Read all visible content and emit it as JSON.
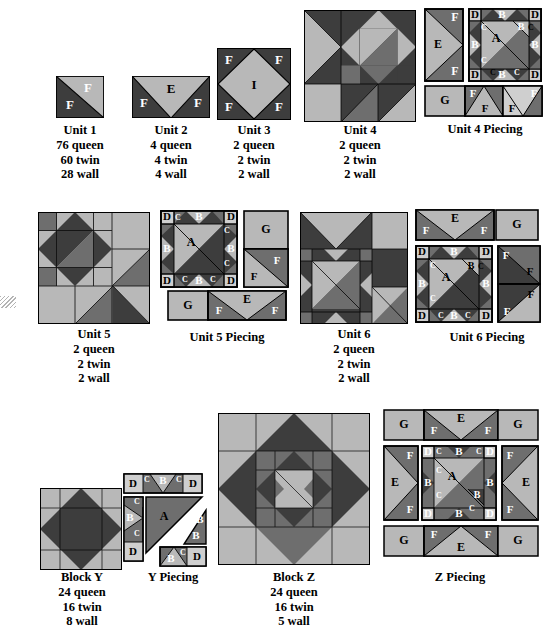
{
  "page": {
    "background": "#ffffff"
  },
  "palette": {
    "dark": "#3d3d3d",
    "medium": "#6e6e6e",
    "light": "#b8b8b8",
    "pale": "#cfcfcf",
    "outline": "#000000",
    "label_light": "#ffffff",
    "label_dark": "#000000"
  },
  "patch_codes": {
    "A": "large light triangle",
    "B": "medium triangle",
    "C": "small dark triangle",
    "D": "light corner square",
    "E": "large light triangle in rectangle",
    "F": "half square triangle",
    "G": "plain light rectangle",
    "I": "large light center square on point"
  },
  "figures": [
    {
      "id": "unit-1",
      "name": "Unit 1",
      "caption": [
        "Unit 1",
        "76 queen",
        "60 twin",
        "28 wall"
      ],
      "labels": [
        "F",
        "F"
      ]
    },
    {
      "id": "unit-2",
      "name": "Unit 2",
      "caption": [
        "Unit 2",
        "4 queen",
        "4 twin",
        "4 wall"
      ],
      "labels": [
        "F",
        "E",
        "F"
      ]
    },
    {
      "id": "unit-3",
      "name": "Unit 3",
      "caption": [
        "Unit 3",
        "2 queen",
        "2 twin",
        "2 wall"
      ],
      "labels": [
        "F",
        "F",
        "I",
        "F",
        "F"
      ]
    },
    {
      "id": "unit-4",
      "name": "Unit 4",
      "caption": [
        "Unit 4",
        "2 queen",
        "2 twin",
        "2 wall"
      ],
      "labels": []
    },
    {
      "id": "unit-4-piecing",
      "name": "Unit 4 Piecing",
      "caption": [
        "Unit 4 Piecing"
      ],
      "labels": [
        "F",
        "E",
        "F",
        "D",
        "B",
        "B",
        "D",
        "C",
        "C",
        "B",
        "A",
        "B",
        "C",
        "C",
        "D",
        "B",
        "D",
        "G",
        "F",
        "F",
        "F",
        "F"
      ]
    },
    {
      "id": "unit-5",
      "name": "Unit 5",
      "caption": [
        "Unit 5",
        "2 queen",
        "2 twin",
        "2 wall"
      ],
      "labels": []
    },
    {
      "id": "unit-5-piecing",
      "name": "Unit 5 Piecing",
      "caption": [
        "Unit 5 Piecing"
      ],
      "labels": [
        "D",
        "C",
        "B",
        "D",
        "B",
        "C",
        "B",
        "A",
        "B",
        "C",
        "D",
        "C",
        "B",
        "C",
        "D",
        "G",
        "F",
        "F",
        "G",
        "F",
        "E",
        "F"
      ]
    },
    {
      "id": "unit-6",
      "name": "Unit 6",
      "caption": [
        "Unit 6",
        "2 queen",
        "2 twin",
        "2 wall"
      ],
      "labels": []
    },
    {
      "id": "unit-6-piecing",
      "name": "Unit 6 Piecing",
      "caption": [
        "Unit 6 Piecing"
      ],
      "labels": [
        "F",
        "E",
        "F",
        "G",
        "D",
        "B",
        "D",
        "C",
        "B",
        "C",
        "B",
        "A",
        "B",
        "C",
        "C",
        "D",
        "B",
        "D",
        "F",
        "F",
        "F",
        "F"
      ]
    },
    {
      "id": "block-y",
      "name": "Block Y",
      "caption": [
        "Block Y",
        "24 queen",
        "16 twin",
        "8 wall"
      ],
      "labels": []
    },
    {
      "id": "y-piecing",
      "name": "Y Piecing",
      "caption": [
        "Y Piecing"
      ],
      "labels": [
        "D",
        "C",
        "B",
        "C",
        "D",
        "C",
        "B",
        "C",
        "D",
        "A",
        "B",
        "B",
        "B",
        "C",
        "D"
      ]
    },
    {
      "id": "block-z",
      "name": "Block Z",
      "caption": [
        "Block Z",
        "24 queen",
        "16 twin",
        "5 wall"
      ],
      "labels": []
    },
    {
      "id": "z-piecing",
      "name": "Z Piecing",
      "caption": [
        "Z Piecing"
      ],
      "labels": [
        "G",
        "F",
        "E",
        "F",
        "G",
        "F",
        "E",
        "F",
        "D",
        "C",
        "B",
        "C",
        "D",
        "C",
        "B",
        "A",
        "B",
        "C",
        "B",
        "C",
        "D",
        "B",
        "D",
        "F",
        "E",
        "F",
        "G",
        "F",
        "E",
        "F",
        "G"
      ]
    }
  ],
  "captions": {
    "unit1": {
      "title": "Unit 1",
      "l1": "76 queen",
      "l2": "60 twin",
      "l3": "28 wall"
    },
    "unit2": {
      "title": "Unit 2",
      "l1": "4 queen",
      "l2": "4 twin",
      "l3": "4 wall"
    },
    "unit3": {
      "title": "Unit 3",
      "l1": "2 queen",
      "l2": "2 twin",
      "l3": "2 wall"
    },
    "unit4": {
      "title": "Unit 4",
      "l1": "2 queen",
      "l2": "2 twin",
      "l3": "2 wall"
    },
    "unit4p": {
      "title": "Unit 4 Piecing"
    },
    "unit5": {
      "title": "Unit 5",
      "l1": "2 queen",
      "l2": "2 twin",
      "l3": "2 wall"
    },
    "unit5p": {
      "title": "Unit 5 Piecing"
    },
    "unit6": {
      "title": "Unit 6",
      "l1": "2 queen",
      "l2": "2 twin",
      "l3": "2 wall"
    },
    "unit6p": {
      "title": "Unit 6 Piecing"
    },
    "blocky": {
      "title": "Block Y",
      "l1": "24 queen",
      "l2": "16 twin",
      "l3": "8 wall"
    },
    "ypiecing": {
      "title": "Y Piecing"
    },
    "blockz": {
      "title": "Block Z",
      "l1": "24 queen",
      "l2": "16 twin",
      "l3": "5 wall"
    },
    "zpiecing": {
      "title": "Z Piecing"
    }
  },
  "letters": {
    "A": "A",
    "B": "B",
    "C": "C",
    "D": "D",
    "E": "E",
    "F": "F",
    "G": "G",
    "I": "I"
  }
}
